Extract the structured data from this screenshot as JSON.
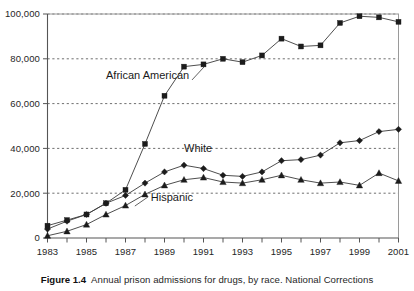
{
  "figure": {
    "caption_label": "Figure 1.4",
    "caption_text": "Annual prison admissions for drugs, by race. National Corrections"
  },
  "chart_data": {
    "type": "line",
    "title": "Annual prison admissions for drugs, by race. National Corrections",
    "xlabel": "",
    "ylabel": "",
    "x": [
      1983,
      1984,
      1985,
      1986,
      1987,
      1988,
      1989,
      1990,
      1991,
      1992,
      1993,
      1994,
      1995,
      1996,
      1997,
      1998,
      1999,
      2000,
      2001
    ],
    "xlim": [
      1983,
      2001
    ],
    "ylim": [
      0,
      100000
    ],
    "x_tick_labels": [
      "1983",
      "1985",
      "1987",
      "1989",
      "1991",
      "1993",
      "1995",
      "1997",
      "1999",
      "2001"
    ],
    "x_tick_values": [
      1983,
      1985,
      1987,
      1989,
      1991,
      1993,
      1995,
      1997,
      1999,
      2001
    ],
    "y_tick_labels": [
      "0",
      "20,000",
      "40,000",
      "60,000",
      "80,000",
      "100,000"
    ],
    "y_tick_values": [
      0,
      20000,
      40000,
      60000,
      80000,
      100000
    ],
    "grid": "horizontal-dashed",
    "legend": "inline-annotations",
    "series": [
      {
        "name": "African American",
        "marker": "square",
        "values": [
          5500,
          8000,
          10500,
          15500,
          21500,
          42000,
          63500,
          76500,
          77500,
          80000,
          78500,
          81500,
          89000,
          85500,
          86000,
          96000,
          99000,
          98500,
          96500
        ]
      },
      {
        "name": "White",
        "marker": "diamond",
        "values": [
          4000,
          7500,
          10500,
          15500,
          19000,
          24500,
          29500,
          32500,
          31000,
          28000,
          27500,
          29500,
          34500,
          35000,
          37000,
          42500,
          43500,
          47500,
          48500
        ]
      },
      {
        "name": "Hispanic",
        "marker": "triangle",
        "values": [
          1000,
          3000,
          6000,
          10500,
          14500,
          19500,
          23500,
          26000,
          27000,
          25000,
          24500,
          26000,
          28000,
          26000,
          24500,
          25000,
          23500,
          29000,
          25500
        ]
      }
    ],
    "annotations": [
      {
        "label": "African American",
        "x": 1986.0,
        "y": 71000
      },
      {
        "label": "White",
        "x": 1990.0,
        "y": 38500
      },
      {
        "label": "Hispanic",
        "x": 1988.3,
        "y": 16500
      }
    ]
  }
}
